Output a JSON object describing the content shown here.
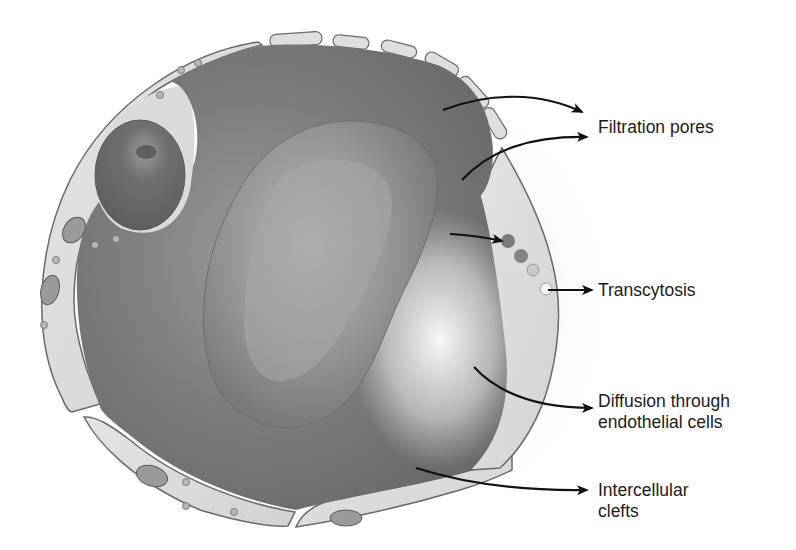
{
  "diagram": {
    "labels": {
      "filtration_pores": "Filtration pores",
      "transcytosis": "Transcytosis",
      "diffusion_line1": "Diffusion through",
      "diffusion_line2": "endothelial cells",
      "intercellular_line1": "Intercellular",
      "intercellular_line2": "clefts"
    },
    "colors": {
      "background": "#ffffff",
      "lumen": "#7a7a7a",
      "endothelium": "#dcdcdc",
      "outline": "#6a6a6a",
      "rbc": "#8c8c8c",
      "arrow": "#111111",
      "text": "#1c1c1c"
    }
  }
}
